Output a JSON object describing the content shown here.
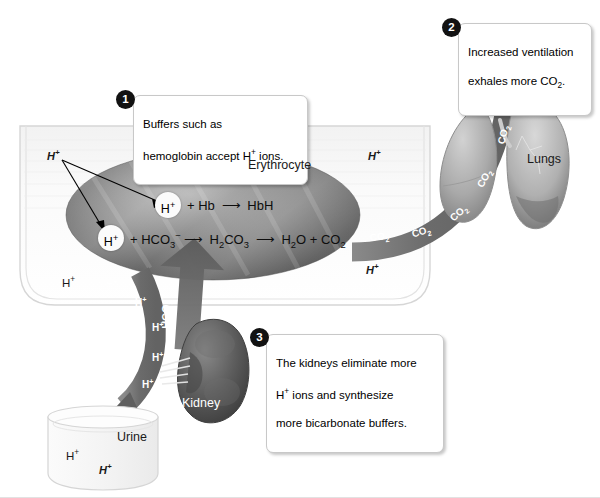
{
  "figure": {
    "background": "#ffffff"
  },
  "callouts": [
    {
      "number": "1",
      "text": "Buffers such as\nhemoglobin accept H+ ions.",
      "line1": "Buffers such as",
      "line2": "hemoglobin accept H",
      "line2_sup": "+",
      "line2_end": " ions."
    },
    {
      "number": "2",
      "text": "Increased ventilation\nexhales more CO2.",
      "line1": "Increased ventilation",
      "line2": "exhales more CO",
      "line2_sub": "2",
      "line2_end": "."
    },
    {
      "number": "3",
      "text": "The kidneys eliminate more\nH+ ions and synthesize\nmore bicarbonate buffers.",
      "line1": "The kidneys eliminate more",
      "line2": "H",
      "line2_sup": "+",
      "line2_end": " ions and synthesize",
      "line3": "more bicarbonate buffers."
    }
  ],
  "organs": {
    "erythrocyte": "Erythrocyte",
    "lungs": "Lungs",
    "kidney": "Kidney",
    "urine": "Urine"
  },
  "equations": {
    "hb_reaction": {
      "ion": "H+",
      "plus": "+ Hb",
      "arrow": "→",
      "product": "HbH"
    },
    "bicarbonate_reaction": {
      "ion": "H+",
      "plus": "+ HCO3−",
      "arrow1": "→",
      "middle": "H2CO3",
      "arrow2": "→",
      "product": "H2O + CO2"
    }
  },
  "flow_labels": {
    "co2": "CO2",
    "hco3": "HCO3−",
    "h_ion": "H+",
    "co2_count": 5,
    "h_ion_count": 5
  },
  "plasma_ions": [
    {
      "text": "H+",
      "style": "italic"
    },
    {
      "text": "H+",
      "style": "italic"
    },
    {
      "text": "H+",
      "style": "italic"
    },
    {
      "text": "H+",
      "style": "plain"
    }
  ],
  "urine_ions": [
    {
      "text": "H+",
      "style": "plain"
    },
    {
      "text": "H+",
      "style": "italic"
    }
  ],
  "colors": {
    "arrow_gray": "#6e6e6e",
    "arrow_gray_dark": "#555555",
    "erythrocyte_dark": "#5f5f5f",
    "erythrocyte_light": "#b9b9b9",
    "kidney": "#585858",
    "lung": "#a8a8a8",
    "vessel_outline": "#d2d2d2",
    "badge": "#121212",
    "callout_border": "#c8c8c8"
  }
}
